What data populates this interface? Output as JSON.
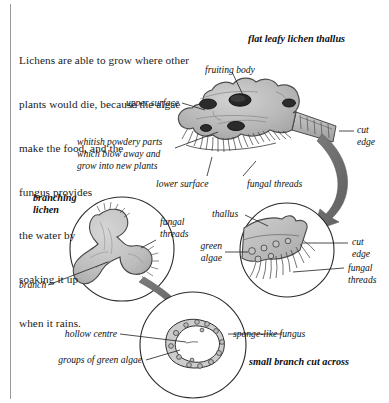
{
  "figure": {
    "title_hidden": "Lichen structure diagram",
    "background_color": "#ffffff",
    "ink_color": "#1a1a1a",
    "thallus_fill": "#b9b9b9",
    "arrow_fill": "#6e6e6e"
  },
  "body_text": {
    "lines": [
      "Lichens are able to grow where other",
      "plants would die, because the algae",
      "make the food, and the",
      "fungus provides",
      "the water by",
      "soaking it up",
      "when it rains."
    ]
  },
  "headings": {
    "flat_leafy": "flat leafy lichen thallus",
    "branching": "branching",
    "branching_2": "lichen",
    "small_branch": "small branch cut across"
  },
  "labels": {
    "fruiting_body": "fruiting body",
    "upper_surface": "upper surface",
    "cut_edge_top": "cut",
    "cut_edge_top_2": "edge",
    "whitish_1": "whitish powdery parts",
    "whitish_2": "which blow away and",
    "whitish_3": "grow into new plants",
    "lower_surface": "lower surface",
    "fungal_threads_top": "fungal threads",
    "branch": "branch",
    "fungal_threads_branch_1": "fungal",
    "fungal_threads_branch_2": "threads",
    "thallus": "thallus",
    "green_algae_1": "green",
    "green_algae_2": "algae",
    "cut_edge_mid_1": "cut",
    "cut_edge_mid_2": "edge",
    "fungal_threads_mid_1": "fungal",
    "fungal_threads_mid_2": "threads",
    "hollow_centre": "hollow centre",
    "sponge_like_fungus": "sponge-like fungus",
    "groups_green_algae": "groups of green algae"
  }
}
